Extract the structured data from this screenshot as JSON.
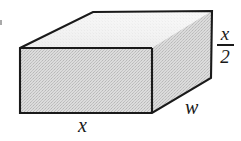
{
  "figure": {
    "kind": "geometry-diagram",
    "shape_name": "rectangular-prism",
    "canvas": {
      "width": 241,
      "height": 141,
      "background": "#ffffff"
    },
    "colors": {
      "outline": "#1a1a1a",
      "front_face_fill": "#d2d2d2",
      "right_face_fill": "#d0d0d0",
      "top_face_fill": "#f0f0f0",
      "label_color": "#1a1a1a",
      "artifact": "#9a9a9a"
    },
    "geometry": {
      "front_face_points": "20,48 152,48 152,113 20,113",
      "top_face_points": "20,48 93,12 212,11 152,48",
      "right_face_points": "152,48 212,11 211,78 152,113",
      "outline_points": "20,48 93,12 212,11 211,78 152,113 20,113",
      "internal_edge_top_front": "20,48 152,48",
      "internal_edge_right_vertical": "152,48 152,113",
      "stroke_width": "2.1"
    },
    "labels": {
      "bottom_edge": {
        "text": "x",
        "meaning": "length of the front bottom edge",
        "position": {
          "x": 78,
          "y": 115
        }
      },
      "depth_edge": {
        "text": "w",
        "meaning": "depth of the box",
        "position": {
          "x": 185,
          "y": 97
        }
      },
      "height_edge": {
        "numerator": "x",
        "denominator": "2",
        "text": "x/2",
        "meaning": "height of the box, one half of x",
        "position": {
          "x": 213,
          "y": 24
        }
      }
    }
  }
}
